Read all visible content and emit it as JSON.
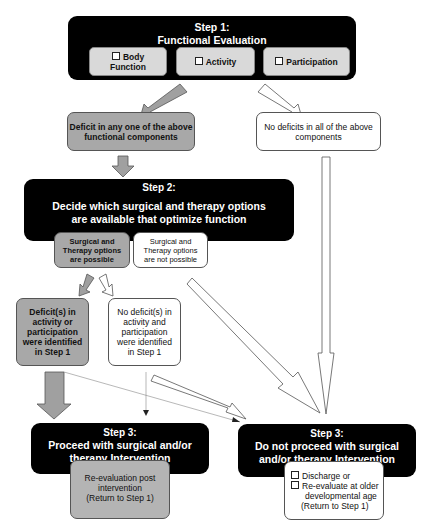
{
  "step1": {
    "title_line1": "Step 1:",
    "title_line2": "Functional Evaluation",
    "components": [
      {
        "label_line1": "Body",
        "label_line2": "Function",
        "icon": "checkbox-icon"
      },
      {
        "label_line1": "Activity",
        "label_line2": "",
        "icon": "checkbox-icon"
      },
      {
        "label_line1": "Participation",
        "label_line2": "",
        "icon": "checkbox-icon"
      }
    ]
  },
  "outcomes1": {
    "deficit": {
      "line1": "Deficit in any one of the above",
      "line2": "functional components"
    },
    "no_deficit": {
      "line1": "No deficits in all of the above",
      "line2": "components"
    }
  },
  "step2": {
    "title_line1": "Step 2:",
    "title_line2": "Decide which surgical and therapy options",
    "title_line3": "are available that optimize function",
    "options": [
      {
        "line1": "Surgical and",
        "line2": "Therapy options",
        "line3": "are possible"
      },
      {
        "line1": "Surgical and",
        "line2": "Therapy options",
        "line3": "are not possible"
      }
    ]
  },
  "outcomes2": {
    "deficit": {
      "lines": [
        "Deficit(s) in",
        "activity or",
        "participation",
        "were identified",
        "in Step 1"
      ]
    },
    "no_deficit": {
      "lines": [
        "No deficit(s) in",
        "activity and",
        "participation",
        "were identified",
        "in Step 1"
      ]
    }
  },
  "step3_proceed": {
    "title_line1": "Step 3:",
    "title_line2": "Proceed with surgical and/or",
    "title_line3": "therapy Intervention",
    "sub": {
      "line1": "Re-evaluation post",
      "line2": "intervention",
      "line3": "(Return to Step 1)"
    }
  },
  "step3_not": {
    "title_line1": "Step 3:",
    "title_line2": "Do not proceed with surgical",
    "title_line3": "and/or therapy Intervention",
    "sub": {
      "item1": "Discharge or",
      "item2_line1": "Re-evaluate at older",
      "item2_line2": "developmental age",
      "item2_line3": "(Return to Step 1)"
    }
  },
  "colors": {
    "black": "#000000",
    "grey_fill": "#a8a8a8",
    "light_fill": "#d9d9d9",
    "arrow_grey": "#a0a0a0",
    "white": "#ffffff"
  }
}
